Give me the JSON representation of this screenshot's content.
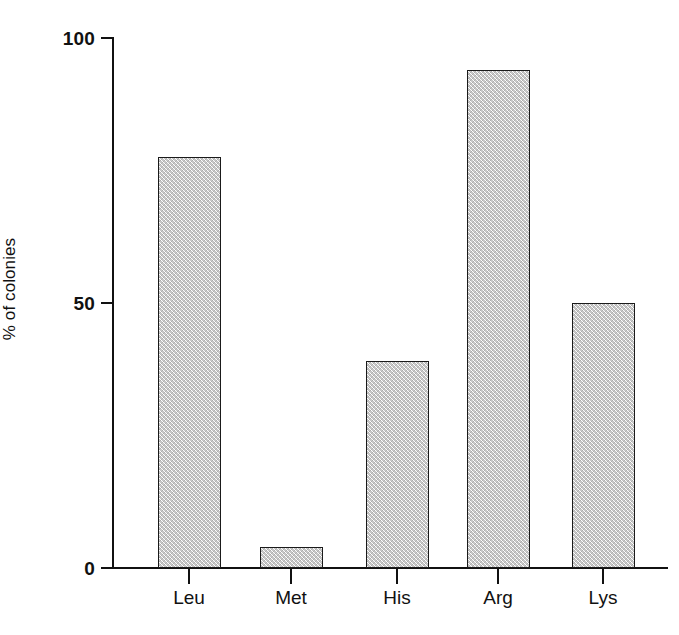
{
  "chart_data": {
    "type": "bar",
    "title": "",
    "xlabel": "",
    "ylabel": "% of colonies",
    "categories": [
      "Leu",
      "Met",
      "His",
      "Arg",
      "Lys"
    ],
    "values": [
      77.5,
      4,
      39,
      94,
      50
    ],
    "ylim": [
      0,
      100
    ],
    "yticks": [
      0,
      50,
      100
    ],
    "ytick_labels": [
      "0",
      "50",
      "100"
    ],
    "grid": false,
    "legend": null,
    "bar_fill": "#c9c9c9",
    "bar_edge": "#1a1a1a",
    "background": "#ffffff"
  },
  "axes": {
    "y_title": "% of colonies",
    "y_ticks": [
      {
        "label": "100",
        "value": 100
      },
      {
        "label": "50",
        "value": 50
      },
      {
        "label": "0",
        "value": 0
      }
    ],
    "x_ticks": [
      {
        "label": "Leu"
      },
      {
        "label": "Met"
      },
      {
        "label": "His"
      },
      {
        "label": "Arg"
      },
      {
        "label": "Lys"
      }
    ]
  }
}
